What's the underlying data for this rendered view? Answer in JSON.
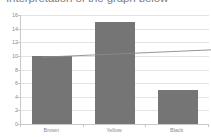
{
  "chart_data": {
    "type": "bar",
    "title": "Interpretation of the graph below",
    "categories": [
      "Brown",
      "Yellow",
      "Black"
    ],
    "values": [
      10,
      15,
      5
    ],
    "series": [
      {
        "name": "Count",
        "values": [
          10,
          15,
          5
        ]
      }
    ],
    "trendline": {
      "name": "Linear trend",
      "x_start": 0,
      "x_end": 1,
      "y_start": 12.0,
      "y_end": 13.2
    },
    "xlabel": "",
    "ylabel": "",
    "ylim": [
      0,
      16
    ],
    "yticks": [
      0,
      2,
      4,
      6,
      8,
      10,
      12,
      14,
      16
    ],
    "ytick_labels": [
      "0",
      "2",
      "4",
      "6",
      "8",
      "10",
      "12",
      "14",
      "16"
    ],
    "grid": true,
    "legend": false,
    "legend_position": "none",
    "colors": {
      "bar": "#757575",
      "trendline": "#8a8a8a",
      "gridline": "#e3e3e3",
      "axis": "#c8c8c8",
      "tick_text": "#8c8c8c",
      "title_text": "#7d7d7d",
      "background": "#ffffff"
    }
  }
}
